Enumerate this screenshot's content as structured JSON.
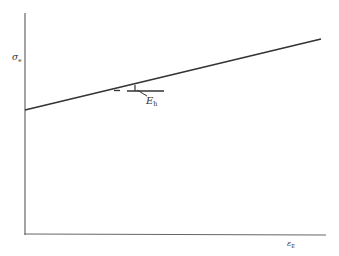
{
  "diagram": {
    "type": "linear-hardening stress-strain sketch",
    "y_axis_label": {
      "main": "σ",
      "sub": "e"
    },
    "x_axis_label": {
      "main": "ε",
      "sub": "E"
    },
    "slope_label": {
      "main": "E",
      "sub": "h"
    },
    "line": {
      "description": "straight line with positive slope starting above origin on the y-axis"
    },
    "colors": {
      "axis": "#555555",
      "line": "#333333",
      "background": "#ffffff"
    }
  }
}
